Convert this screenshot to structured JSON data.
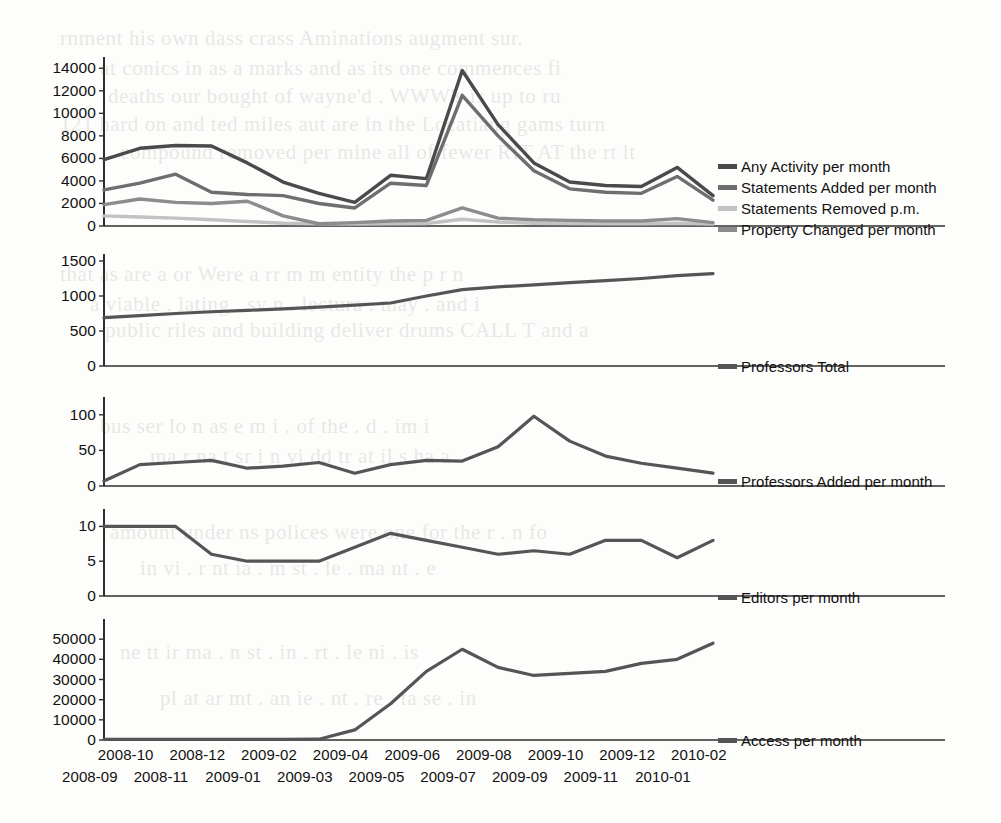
{
  "chart_data": [
    {
      "type": "line",
      "title": "",
      "panel_name": "activity-panel",
      "xlabel": "",
      "ylabel": "",
      "grid": false,
      "legend_position": "right",
      "ylim": [
        0,
        15000
      ],
      "yticks": [
        0,
        2000,
        4000,
        6000,
        8000,
        10000,
        12000,
        14000
      ],
      "x": [
        "2008-09",
        "2008-10",
        "2008-11",
        "2008-12",
        "2009-01",
        "2009-02",
        "2009-03",
        "2009-04",
        "2009-05",
        "2009-06",
        "2009-07",
        "2009-08",
        "2009-09",
        "2009-10",
        "2009-11",
        "2009-12",
        "2010-01",
        "2010-02"
      ],
      "series": [
        {
          "name": "Any Activity per month",
          "color": "#4a4a4a",
          "values": [
            5900,
            6900,
            7150,
            7100,
            5600,
            3900,
            2900,
            2100,
            4500,
            4200,
            13800,
            9000,
            5600,
            3900,
            3600,
            3500,
            5200,
            2700
          ]
        },
        {
          "name": "Statements Added per month",
          "color": "#6e6e6e",
          "values": [
            3200,
            3800,
            4600,
            3000,
            2800,
            2700,
            2000,
            1600,
            3800,
            3600,
            11600,
            8000,
            4900,
            3300,
            3000,
            2900,
            4400,
            2300
          ]
        },
        {
          "name": "Statements Removed p.m.",
          "color": "#c2c2c2",
          "values": [
            900,
            800,
            700,
            550,
            400,
            250,
            200,
            180,
            200,
            220,
            600,
            350,
            250,
            220,
            200,
            200,
            250,
            180
          ]
        },
        {
          "name": "Property Changed per month",
          "color": "#8c8c8c",
          "values": [
            1900,
            2400,
            2100,
            2000,
            2200,
            900,
            200,
            300,
            450,
            500,
            1600,
            700,
            550,
            500,
            450,
            450,
            650,
            300
          ]
        }
      ]
    },
    {
      "type": "line",
      "title": "",
      "panel_name": "professors-total-panel",
      "xlabel": "",
      "ylabel": "",
      "grid": false,
      "legend_position": "right",
      "ylim": [
        0,
        1600
      ],
      "yticks": [
        0,
        500,
        1000,
        1500
      ],
      "x": [
        "2008-09",
        "2008-10",
        "2008-11",
        "2008-12",
        "2009-01",
        "2009-02",
        "2009-03",
        "2009-04",
        "2009-05",
        "2009-06",
        "2009-07",
        "2009-08",
        "2009-09",
        "2009-10",
        "2009-11",
        "2009-12",
        "2010-01",
        "2010-02"
      ],
      "series": [
        {
          "name": "Professors Total",
          "color": "#555555",
          "values": [
            690,
            720,
            750,
            775,
            795,
            815,
            840,
            870,
            900,
            1000,
            1090,
            1130,
            1160,
            1190,
            1220,
            1250,
            1290,
            1320
          ]
        }
      ]
    },
    {
      "type": "line",
      "title": "",
      "panel_name": "professors-added-panel",
      "xlabel": "",
      "ylabel": "",
      "grid": false,
      "legend_position": "right",
      "ylim": [
        0,
        125
      ],
      "yticks": [
        0,
        50,
        100
      ],
      "x": [
        "2008-09",
        "2008-10",
        "2008-11",
        "2008-12",
        "2009-01",
        "2009-02",
        "2009-03",
        "2009-04",
        "2009-05",
        "2009-06",
        "2009-07",
        "2009-08",
        "2009-09",
        "2009-10",
        "2009-11",
        "2009-12",
        "2010-01",
        "2010-02"
      ],
      "series": [
        {
          "name": "Professors Added per month",
          "color": "#555555",
          "values": [
            7,
            30,
            33,
            36,
            25,
            28,
            33,
            18,
            30,
            36,
            35,
            55,
            98,
            63,
            42,
            32,
            25,
            18
          ]
        }
      ]
    },
    {
      "type": "line",
      "title": "",
      "panel_name": "editors-panel",
      "xlabel": "",
      "ylabel": "",
      "grid": false,
      "legend_position": "right",
      "ylim": [
        0,
        12.5
      ],
      "yticks": [
        0,
        5,
        10
      ],
      "x": [
        "2008-09",
        "2008-10",
        "2008-11",
        "2008-12",
        "2009-01",
        "2009-02",
        "2009-03",
        "2009-04",
        "2009-05",
        "2009-06",
        "2009-07",
        "2009-08",
        "2009-09",
        "2009-10",
        "2009-11",
        "2009-12",
        "2010-01",
        "2010-02"
      ],
      "series": [
        {
          "name": "Editors per month",
          "color": "#555555",
          "values": [
            10,
            10,
            10,
            6,
            5,
            5,
            5,
            7,
            9,
            8,
            7,
            6,
            6.5,
            6,
            8,
            8,
            5.5,
            8
          ]
        }
      ]
    },
    {
      "type": "line",
      "title": "",
      "panel_name": "access-panel",
      "xlabel": "",
      "ylabel": "",
      "grid": false,
      "legend_position": "right",
      "ylim": [
        0,
        60000
      ],
      "yticks": [
        0,
        10000,
        20000,
        30000,
        40000,
        50000
      ],
      "x": [
        "2008-09",
        "2008-10",
        "2008-11",
        "2008-12",
        "2009-01",
        "2009-02",
        "2009-03",
        "2009-04",
        "2009-05",
        "2009-06",
        "2009-07",
        "2009-08",
        "2009-09",
        "2009-10",
        "2009-11",
        "2009-12",
        "2010-01",
        "2010-02"
      ],
      "series": [
        {
          "name": "Access per month",
          "color": "#555555",
          "values": [
            300,
            300,
            300,
            300,
            300,
            300,
            400,
            5000,
            18000,
            34000,
            45000,
            36000,
            32000,
            33000,
            34000,
            38000,
            40000,
            48000
          ]
        }
      ]
    }
  ],
  "panels": [
    {
      "id": "activity",
      "yticks": [
        "14000",
        "12000",
        "10000",
        "8000",
        "6000",
        "4000",
        "2000",
        "0"
      ],
      "legend": [
        {
          "label": "Any Activity per month",
          "color": "#4a4a4a"
        },
        {
          "label": "Statements Added per month",
          "color": "#6e6e6e"
        },
        {
          "label": "Statements Removed p.m.",
          "color": "#c2c2c2"
        },
        {
          "label": "Property Changed per month",
          "color": "#8c8c8c"
        }
      ]
    },
    {
      "id": "professors-total",
      "yticks": [
        "1500",
        "1000",
        "500",
        "0"
      ],
      "legend": [
        {
          "label": "Professors Total",
          "color": "#555555"
        }
      ]
    },
    {
      "id": "professors-added",
      "yticks": [
        "100",
        "50",
        "0"
      ],
      "legend": [
        {
          "label": "Professors Added per month",
          "color": "#555555"
        }
      ]
    },
    {
      "id": "editors",
      "yticks": [
        "10",
        "5",
        "0"
      ],
      "legend": [
        {
          "label": "Editors per month",
          "color": "#555555"
        }
      ]
    },
    {
      "id": "access",
      "yticks": [
        "50000",
        "40000",
        "30000",
        "20000",
        "10000",
        "0"
      ],
      "legend": [
        {
          "label": "Access per month",
          "color": "#555555"
        }
      ]
    }
  ],
  "xaxis": {
    "top_row": [
      "2008-10",
      "2008-12",
      "2009-02",
      "2009-04",
      "2009-06",
      "2009-08",
      "2009-10",
      "2009-12",
      "2010-02"
    ],
    "bottom_row": [
      "2008-09",
      "2008-11",
      "2009-01",
      "2009-03",
      "2009-05",
      "2009-07",
      "2009-09",
      "2009-11",
      "2010-01"
    ]
  },
  "scan_bleed": [
    {
      "text": "rnment his own dass crass Aminations  augment  sur.",
      "x": 60,
      "y": 26
    },
    {
      "text": "at  conics  in  as  a  marks  and  as  its  one  commences  fi",
      "x": 100,
      "y": 56
    },
    {
      "text": "deaths  our  bought  of  wayne'd  .  WWW's  is  up  to  ru",
      "x": 108,
      "y": 84
    },
    {
      "text": "121  hard  on  and  ted  miles  aut  are  in  the  Locatiang  gams  turn",
      "x": 60,
      "y": 112
    },
    {
      "text": "compound  removed  per  mine  all  of  fewer  RIT  AT  the  rt  lt",
      "x": 120,
      "y": 140
    },
    {
      "text": "that  as  are  a  or  Were  a  rr  m  m  entity  the  p  r  n",
      "x": 60,
      "y": 262
    },
    {
      "text": "a  viable  .  lating  .  sv  n  .  lectura  .  may  .  and  i",
      "x": 90,
      "y": 292
    },
    {
      "text": "public  riles  and  building  deliver  drums  CALL  T  and  a",
      "x": 105,
      "y": 318
    },
    {
      "text": "bus  ser  lo  n  as  e  m  i  .  of  the  .  d  .  im  i",
      "x": 100,
      "y": 414
    },
    {
      "text": "ma  r  na  t  sr  i  n  vi  dd  tr  at  il  s  ha  a",
      "x": 150,
      "y": 444
    },
    {
      "text": "amount  under  ns  polices  were  one  for  the  r  .  n  fo",
      "x": 110,
      "y": 520
    },
    {
      "text": "in  vi  .  r  nt  ia  .  m  st  .  le  .  ma  nt  .  e",
      "x": 140,
      "y": 556
    },
    {
      "text": "ne  tt  ir  ma  .  n  st  .  in  .  rt  .  le  ni  .  is",
      "x": 120,
      "y": 640
    },
    {
      "text": "pl  at  ar  mt  .  an  ie  .  nt  .  re  .  ta  se  .  in",
      "x": 160,
      "y": 686
    }
  ]
}
